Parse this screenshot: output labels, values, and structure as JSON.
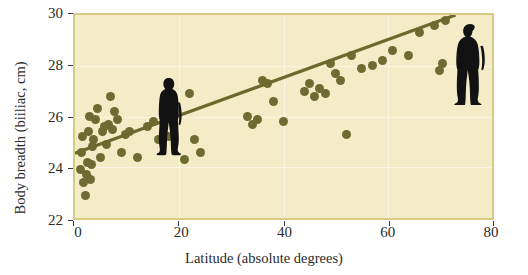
{
  "chart_data": {
    "type": "scatter",
    "title": "",
    "xlabel": "Latitude (absolute degrees)",
    "ylabel": "Body breadth (biiliac, cm)",
    "xlim": [
      0,
      80
    ],
    "ylim": [
      22,
      30
    ],
    "xticks": [
      0,
      20,
      40,
      60,
      80
    ],
    "yticks": [
      22,
      24,
      26,
      28,
      30
    ],
    "xtick_labels": [
      "0",
      "20",
      "40",
      "60",
      "80"
    ],
    "ytick_labels": [
      "22",
      "24",
      "26",
      "28",
      "30"
    ],
    "grid": true,
    "legend": "none",
    "point_color": "#6e6b32",
    "line_color": "#6b6a2e",
    "panel_color": "#f4ecc6",
    "panel_border_color": "#d9cb85",
    "series": [
      {
        "name": "Population samples",
        "points": [
          [
            1.0,
            23.9
          ],
          [
            1.2,
            24.6
          ],
          [
            1.4,
            25.2
          ],
          [
            1.6,
            23.4
          ],
          [
            2.0,
            22.9
          ],
          [
            2.2,
            23.7
          ],
          [
            2.4,
            24.2
          ],
          [
            2.6,
            25.4
          ],
          [
            2.8,
            26.0
          ],
          [
            3.0,
            23.5
          ],
          [
            3.2,
            24.1
          ],
          [
            3.4,
            24.8
          ],
          [
            3.6,
            25.1
          ],
          [
            4.0,
            25.9
          ],
          [
            4.4,
            26.3
          ],
          [
            4.8,
            24.4
          ],
          [
            5.2,
            25.4
          ],
          [
            5.6,
            25.6
          ],
          [
            6.0,
            24.9
          ],
          [
            6.4,
            25.7
          ],
          [
            6.8,
            26.8
          ],
          [
            7.2,
            25.5
          ],
          [
            7.6,
            26.2
          ],
          [
            8.2,
            25.9
          ],
          [
            9.0,
            24.6
          ],
          [
            9.6,
            25.3
          ],
          [
            10.4,
            25.4
          ],
          [
            12.0,
            24.4
          ],
          [
            14.0,
            25.6
          ],
          [
            15.0,
            25.8
          ],
          [
            16.0,
            25.1
          ],
          [
            17.0,
            25.3
          ],
          [
            18.0,
            25.2
          ],
          [
            21.0,
            24.3
          ],
          [
            22.0,
            26.9
          ],
          [
            23.0,
            25.1
          ],
          [
            24.0,
            24.6
          ],
          [
            33.0,
            26.0
          ],
          [
            34.0,
            25.7
          ],
          [
            35.0,
            25.9
          ],
          [
            36.0,
            27.4
          ],
          [
            37.0,
            27.3
          ],
          [
            38.0,
            26.6
          ],
          [
            40.0,
            25.8
          ],
          [
            44.0,
            27.0
          ],
          [
            45.0,
            27.3
          ],
          [
            46.0,
            26.8
          ],
          [
            47.0,
            27.1
          ],
          [
            48.0,
            26.9
          ],
          [
            49.0,
            28.1
          ],
          [
            50.0,
            27.7
          ],
          [
            51.0,
            27.4
          ],
          [
            52.0,
            25.3
          ],
          [
            53.0,
            28.4
          ],
          [
            55.0,
            27.9
          ],
          [
            57.0,
            28.0
          ],
          [
            59.0,
            28.2
          ],
          [
            61.0,
            28.6
          ],
          [
            64.0,
            28.4
          ],
          [
            66.0,
            29.3
          ],
          [
            69.0,
            29.6
          ],
          [
            70.0,
            27.8
          ],
          [
            70.5,
            28.1
          ],
          [
            71.0,
            29.8
          ]
        ]
      }
    ],
    "trendline": {
      "name": "regression line",
      "x0": 0,
      "y0": 24.55,
      "x1": 73,
      "y1": 30.0
    },
    "annotations": [
      {
        "name": "slim-tropical-human-silhouette",
        "x": 12,
        "y": 23.4,
        "description": "tall slender human figure at low latitude"
      },
      {
        "name": "stocky-arctic-human-silhouette",
        "x": 74,
        "y": 28.9,
        "description": "broad stocky human figure at high latitude"
      }
    ]
  }
}
